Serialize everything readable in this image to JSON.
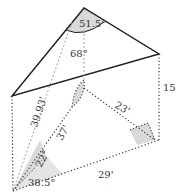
{
  "diagram": {
    "colors": {
      "line": "#1e1e1e",
      "dotted": "#3a3a3a",
      "dashed": "#9a9a9a",
      "shade": "#d9d9d9",
      "text": "#3a3a3a"
    },
    "labels": {
      "apex_angle": "51.5°",
      "inner_angle": "68°",
      "height": "15'",
      "slant": "39.93'",
      "inner_edge": "37'",
      "right_edge": "23'",
      "base_edge": "29'",
      "angle_upper": "22°",
      "angle_lower": "38.5°"
    }
  }
}
